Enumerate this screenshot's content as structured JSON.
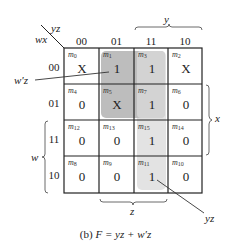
{
  "kmap": {
    "corner": {
      "row_var": "wx",
      "col_var": "yz"
    },
    "col_headers": [
      "00",
      "01",
      "11",
      "10"
    ],
    "row_headers": [
      "00",
      "01",
      "11",
      "10"
    ],
    "cells": [
      [
        {
          "m": "m",
          "sub": "0",
          "v": "X"
        },
        {
          "m": "m",
          "sub": "1",
          "v": "1"
        },
        {
          "m": "m",
          "sub": "3",
          "v": "1"
        },
        {
          "m": "m",
          "sub": "2",
          "v": "X"
        }
      ],
      [
        {
          "m": "m",
          "sub": "4",
          "v": "0"
        },
        {
          "m": "m",
          "sub": "5",
          "v": "X"
        },
        {
          "m": "m",
          "sub": "7",
          "v": "1"
        },
        {
          "m": "m",
          "sub": "6",
          "v": "0"
        }
      ],
      [
        {
          "m": "m",
          "sub": "12",
          "v": "0"
        },
        {
          "m": "m",
          "sub": "13",
          "v": "0"
        },
        {
          "m": "m",
          "sub": "15",
          "v": "1"
        },
        {
          "m": "m",
          "sub": "14",
          "v": "0"
        }
      ],
      [
        {
          "m": "m",
          "sub": "8",
          "v": "0"
        },
        {
          "m": "m",
          "sub": "9",
          "v": "0"
        },
        {
          "m": "m",
          "sub": "11",
          "v": "1"
        },
        {
          "m": "m",
          "sub": "10",
          "v": "0"
        }
      ]
    ],
    "braces": {
      "top": "y",
      "right": "x",
      "left": "w",
      "bottom": "z"
    },
    "groups": [
      {
        "label": "w'z",
        "color": "#bdbdbd"
      },
      {
        "label": "yz",
        "color": "#e3e3e3"
      }
    ]
  },
  "caption": {
    "prefix": "(b) ",
    "expr": "F = yz + w′z"
  }
}
